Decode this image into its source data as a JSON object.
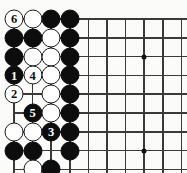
{
  "diagram": {
    "kind": "go-board-diagram",
    "title": "",
    "board_region": "upper-left corner",
    "columns": 9,
    "rows": 8,
    "geometry": {
      "origin_x": 14,
      "origin_y": 19,
      "step_x": 18.6,
      "step_y": 18.8,
      "stone_diameter": 19,
      "line_color": "#3a3a3a",
      "black_color": "#0d0d0d",
      "white_color": "#ffffff",
      "background_color": "#fbfbfa"
    },
    "edges": {
      "top_edge": true,
      "left_edge": true,
      "right_open": true,
      "bottom_open": true
    },
    "hoshi": [
      {
        "col": 8,
        "row": 3
      },
      {
        "col": 4,
        "row": 8
      },
      {
        "col": 8,
        "row": 8
      }
    ],
    "stones": [
      {
        "col": 1,
        "row": 1,
        "color": "white",
        "label": "6"
      },
      {
        "col": 2,
        "row": 1,
        "color": "white",
        "label": ""
      },
      {
        "col": 3,
        "row": 1,
        "color": "black",
        "label": ""
      },
      {
        "col": 4,
        "row": 1,
        "color": "black",
        "label": ""
      },
      {
        "col": 1,
        "row": 2,
        "color": "black",
        "label": ""
      },
      {
        "col": 2,
        "row": 2,
        "color": "black",
        "label": ""
      },
      {
        "col": 3,
        "row": 2,
        "color": "white",
        "label": ""
      },
      {
        "col": 4,
        "row": 2,
        "color": "black",
        "label": ""
      },
      {
        "col": 1,
        "row": 3,
        "color": "black",
        "label": ""
      },
      {
        "col": 2,
        "row": 3,
        "color": "white",
        "label": ""
      },
      {
        "col": 3,
        "row": 3,
        "color": "white",
        "label": ""
      },
      {
        "col": 4,
        "row": 3,
        "color": "black",
        "label": ""
      },
      {
        "col": 1,
        "row": 4,
        "color": "black",
        "label": "1"
      },
      {
        "col": 2,
        "row": 4,
        "color": "white",
        "label": "4"
      },
      {
        "col": 3,
        "row": 4,
        "color": "white",
        "label": ""
      },
      {
        "col": 4,
        "row": 4,
        "color": "black",
        "label": ""
      },
      {
        "col": 1,
        "row": 5,
        "color": "white",
        "label": "2"
      },
      {
        "col": 3,
        "row": 5,
        "color": "white",
        "label": ""
      },
      {
        "col": 4,
        "row": 5,
        "color": "black",
        "label": ""
      },
      {
        "col": 2,
        "row": 6,
        "color": "black",
        "label": "5"
      },
      {
        "col": 3,
        "row": 6,
        "color": "white",
        "label": ""
      },
      {
        "col": 4,
        "row": 6,
        "color": "black",
        "label": ""
      },
      {
        "col": 1,
        "row": 7,
        "color": "white",
        "label": ""
      },
      {
        "col": 2,
        "row": 7,
        "color": "white",
        "label": ""
      },
      {
        "col": 3,
        "row": 7,
        "color": "black",
        "label": "3"
      },
      {
        "col": 4,
        "row": 7,
        "color": "black",
        "label": ""
      },
      {
        "col": 1,
        "row": 8,
        "color": "black",
        "label": ""
      },
      {
        "col": 2,
        "row": 8,
        "color": "black",
        "label": ""
      },
      {
        "col": 4,
        "row": 8,
        "color": "black",
        "label": ""
      },
      {
        "col": 2,
        "row": 9,
        "color": "white",
        "label": ""
      },
      {
        "col": 3,
        "row": 9,
        "color": "black",
        "label": ""
      },
      {
        "col": 3,
        "row": 10,
        "color": "white",
        "label": ""
      }
    ],
    "move_sequence": [
      {
        "number": "1",
        "color": "black"
      },
      {
        "number": "2",
        "color": "white"
      },
      {
        "number": "3",
        "color": "black"
      },
      {
        "number": "4",
        "color": "white"
      },
      {
        "number": "5",
        "color": "black"
      },
      {
        "number": "6",
        "color": "white"
      }
    ]
  }
}
